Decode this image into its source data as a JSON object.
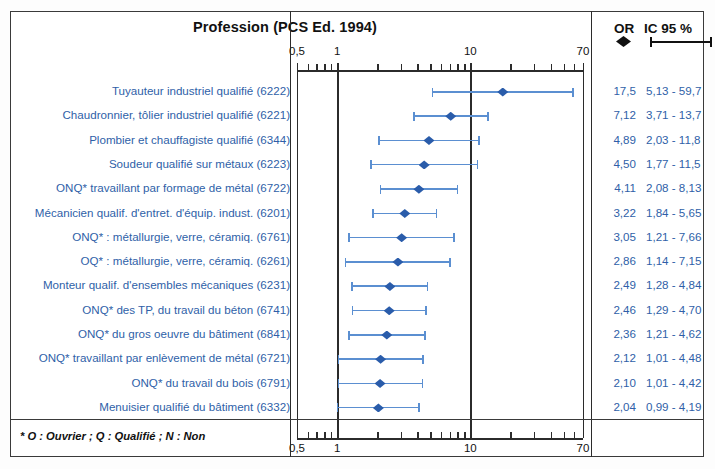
{
  "header": {
    "title": "Profession (PCS Ed. 1994)",
    "or_label": "OR",
    "ci_label": "IC 95 %",
    "or_symbol": "diamond-marker",
    "ci_symbol": "whisker-line"
  },
  "footnote": "* O : Ouvrier ; Q : Qualifié ; N : Non",
  "axis": {
    "scale": "log",
    "tick_labels": [
      "0,5",
      "1",
      "10",
      "70"
    ],
    "tick_values": [
      0.5,
      1,
      10,
      70
    ],
    "minor_ticks": [
      0.6,
      0.7,
      0.8,
      0.9,
      2,
      3,
      4,
      5,
      6,
      7,
      8,
      9,
      20,
      30,
      40,
      50,
      60
    ],
    "reference_value": 1
  },
  "chart_data": {
    "type": "forest",
    "title": "Profession (PCS Ed. 1994)",
    "xlabel": "",
    "ylabel": "",
    "xscale": "log",
    "xlim": [
      0.5,
      70
    ],
    "xticks": [
      0.5,
      1,
      10,
      70
    ],
    "xticklabels": [
      "0,5",
      "1",
      "10",
      "70"
    ],
    "reference_line": 1,
    "grid": false,
    "legend": {
      "position": "top-right",
      "entries": [
        "OR",
        "IC 95 %"
      ]
    },
    "columns": [
      "Profession (PCS Ed. 1994)",
      "OR",
      "IC 95 %"
    ],
    "rows": [
      {
        "label": "Tuyauteur industriel qualifié (6222)",
        "or": 17.5,
        "or_text": "17,5",
        "low": 5.13,
        "high": 59.7,
        "ci_text": "5,13 - 59,7"
      },
      {
        "label": "Chaudronnier, tôlier industriel qualifié (6221)",
        "or": 7.12,
        "or_text": "7,12",
        "low": 3.71,
        "high": 13.7,
        "ci_text": "3,71 - 13,7"
      },
      {
        "label": "Plombier et chauffagiste qualifié (6344)",
        "or": 4.89,
        "or_text": "4,89",
        "low": 2.03,
        "high": 11.8,
        "ci_text": "2,03 - 11,8"
      },
      {
        "label": "Soudeur qualifié sur métaux (6223)",
        "or": 4.5,
        "or_text": "4,50",
        "low": 1.77,
        "high": 11.5,
        "ci_text": "1,77 - 11,5"
      },
      {
        "label": "ONQ* travaillant par formage de métal (6722)",
        "or": 4.11,
        "or_text": "4,11",
        "low": 2.08,
        "high": 8.13,
        "ci_text": "2,08 - 8,13"
      },
      {
        "label": "Mécanicien qualif. d'entret. d'équip. indust. (6201)",
        "or": 3.22,
        "or_text": "3,22",
        "low": 1.84,
        "high": 5.65,
        "ci_text": "1,84 - 5,65"
      },
      {
        "label": "ONQ* : métallurgie, verre, céramiq. (6761)",
        "or": 3.05,
        "or_text": "3,05",
        "low": 1.21,
        "high": 7.66,
        "ci_text": "1,21 - 7,66"
      },
      {
        "label": "OQ* : métallurgie, verre, céramiq. (6261)",
        "or": 2.86,
        "or_text": "2,86",
        "low": 1.14,
        "high": 7.15,
        "ci_text": "1,14 - 7,15"
      },
      {
        "label": "Monteur qualif. d'ensembles mécaniques (6231)",
        "or": 2.49,
        "or_text": "2,49",
        "low": 1.28,
        "high": 4.84,
        "ci_text": "1,28 - 4,84"
      },
      {
        "label": "ONQ* des TP, du travail du béton (6741)",
        "or": 2.46,
        "or_text": "2,46",
        "low": 1.29,
        "high": 4.7,
        "ci_text": "1,29 - 4,70"
      },
      {
        "label": "ONQ* du gros oeuvre du bâtiment (6841)",
        "or": 2.36,
        "or_text": "2,36",
        "low": 1.21,
        "high": 4.62,
        "ci_text": "1,21 - 4,62"
      },
      {
        "label": "ONQ* travaillant par enlèvement de métal (6721)",
        "or": 2.12,
        "or_text": "2,12",
        "low": 1.01,
        "high": 4.48,
        "ci_text": "1,01 - 4,48"
      },
      {
        "label": "ONQ* du travail du bois (6791)",
        "or": 2.1,
        "or_text": "2,10",
        "low": 1.01,
        "high": 4.42,
        "ci_text": "1,01 - 4,42"
      },
      {
        "label": "Menuisier qualifié du bâtiment (6332)",
        "or": 2.04,
        "or_text": "2,04",
        "low": 0.99,
        "high": 4.19,
        "ci_text": "0,99 - 4,19"
      }
    ]
  },
  "colors": {
    "marker": "#2a5caa",
    "whisker": "#5b8fd1",
    "text_blue": "#2f5fa8",
    "axis": "#2b2b2b",
    "frame": "#3a3a3a"
  }
}
